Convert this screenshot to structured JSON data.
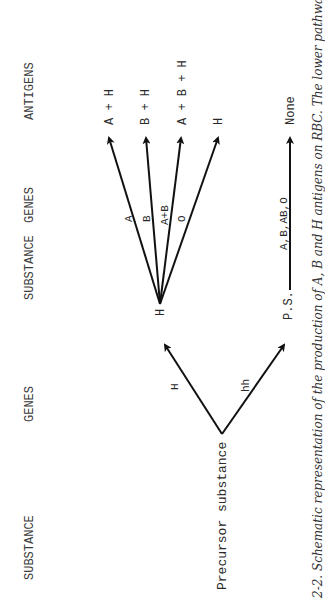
{
  "headers": {
    "substance_1": "SUBSTANCE",
    "genes_1": "GENES",
    "substance_2": "SUBSTANCE",
    "genes_2": "GENES",
    "antigens": "ANTIGENS"
  },
  "nodes": {
    "precursor": "Precursor substance",
    "h_substance": "H",
    "ps": "P.S."
  },
  "genes": {
    "h": "H",
    "hh": "hh",
    "a": "A",
    "b": "B",
    "ab": "A+B",
    "o": "O",
    "ps_genes": "A,B,AB,O"
  },
  "antigens": {
    "a_h": "A + H",
    "b_h": "B + H",
    "a_b_h": "A + B + H",
    "h": "H",
    "none": "None"
  },
  "caption": "2-2. Schematic representation of the production of A, B and H antigens on RBC. The lower pathway shows the develo"
}
